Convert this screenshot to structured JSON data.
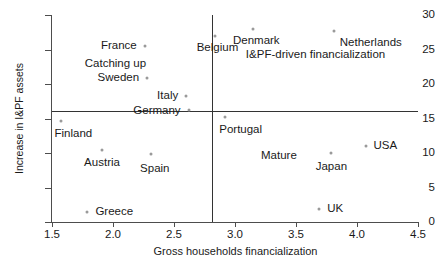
{
  "chart_data": {
    "type": "scatter",
    "title": "",
    "xlabel": "Gross households financialization",
    "ylabel": "Increase in I&PF assets",
    "xlim": [
      1.5,
      4.5
    ],
    "ylim": [
      0,
      30
    ],
    "grid": false,
    "legend": null,
    "xticks": [
      "1.5",
      "2.0",
      "2.5",
      "3.0",
      "3.5",
      "4.0",
      "4.5"
    ],
    "xtick_values": [
      1.5,
      2.0,
      2.5,
      3.0,
      3.5,
      4.0,
      4.5
    ],
    "yticks": [
      "0",
      "5",
      "10",
      "15",
      "20",
      "25",
      "30"
    ],
    "ytick_values": [
      0,
      5,
      10,
      15,
      20,
      25,
      30
    ],
    "reference_lines": {
      "vertical_x": 2.81,
      "horizontal_y": 16.1
    },
    "points": [
      {
        "label": "France",
        "x": 2.26,
        "y": 25.5,
        "label_anchor": "end",
        "label_dx": -8,
        "label_dy": 0
      },
      {
        "label": "Sweden",
        "x": 2.28,
        "y": 20.9,
        "label_anchor": "end",
        "label_dx": -8,
        "label_dy": 0
      },
      {
        "label": "Italy",
        "x": 2.6,
        "y": 18.3,
        "label_anchor": "end",
        "label_dx": -8,
        "label_dy": 0
      },
      {
        "label": "Germany",
        "x": 2.62,
        "y": 16.3,
        "label_anchor": "end",
        "label_dx": -8,
        "label_dy": 1
      },
      {
        "label": "Finland",
        "x": 1.57,
        "y": 14.7,
        "label_anchor": "start",
        "label_dx": -6,
        "label_dy": 13
      },
      {
        "label": "Austria",
        "x": 1.91,
        "y": 10.5,
        "label_anchor": "mid",
        "label_dx": 0,
        "label_dy": 13
      },
      {
        "label": "Spain",
        "x": 2.31,
        "y": 9.8,
        "label_anchor": "mid",
        "label_dx": 4,
        "label_dy": 15
      },
      {
        "label": "Greece",
        "x": 1.79,
        "y": 1.5,
        "label_anchor": "start",
        "label_dx": 8,
        "label_dy": 0
      },
      {
        "label": "Belgium",
        "x": 2.84,
        "y": 26.9,
        "label_anchor": "mid",
        "label_dx": 2,
        "label_dy": 12
      },
      {
        "label": "Denmark",
        "x": 3.15,
        "y": 28.0,
        "label_anchor": "mid",
        "label_dx": 3,
        "label_dy": 12
      },
      {
        "label": "Netherlands",
        "x": 3.81,
        "y": 27.7,
        "label_anchor": "start",
        "label_dx": 6,
        "label_dy": 12
      },
      {
        "label": "Portugal",
        "x": 2.92,
        "y": 15.2,
        "label_anchor": "start",
        "label_dx": -6,
        "label_dy": 13
      },
      {
        "label": "USA",
        "x": 4.07,
        "y": 11.0,
        "label_anchor": "start",
        "label_dx": 8,
        "label_dy": 0
      },
      {
        "label": "Japan",
        "x": 3.79,
        "y": 10.0,
        "label_anchor": "mid",
        "label_dx": 0,
        "label_dy": 14
      },
      {
        "label": "UK",
        "x": 3.69,
        "y": 1.9,
        "label_anchor": "start",
        "label_dx": 8,
        "label_dy": 0
      }
    ],
    "annotations": [
      {
        "text": "Catching up",
        "x": 2.02,
        "y": 22.9
      },
      {
        "text": "I&PF-driven financialization",
        "x": 3.66,
        "y": 24.2
      },
      {
        "text": "Mature",
        "x": 3.36,
        "y": 9.5
      }
    ]
  }
}
